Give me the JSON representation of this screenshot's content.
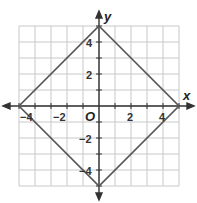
{
  "chart_data": {
    "type": "line",
    "title": "",
    "xlabel": "x",
    "ylabel": "y",
    "xlim": [
      -5,
      5
    ],
    "ylim": [
      -5,
      5
    ],
    "grid": true,
    "x_ticks": [
      -4,
      -2,
      2,
      4
    ],
    "y_ticks": [
      4,
      2,
      -2,
      -4
    ],
    "origin_label": "O",
    "series": [
      {
        "name": "square",
        "points": [
          [
            0,
            5
          ],
          [
            5,
            0
          ],
          [
            0,
            -5
          ],
          [
            -5,
            0
          ],
          [
            0,
            5
          ]
        ],
        "color": "#555555"
      }
    ]
  },
  "labels": {
    "x": "x",
    "y": "y",
    "origin": "O",
    "xt": [
      "−4",
      "−2",
      "2",
      "4"
    ],
    "yt": [
      "4",
      "2",
      "−2",
      "−4"
    ]
  }
}
